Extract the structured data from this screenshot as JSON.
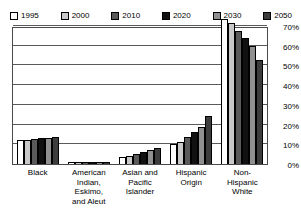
{
  "chart_data": {
    "type": "bar",
    "title": "",
    "xlabel": "",
    "ylabel": "",
    "ylim": [
      0,
      70
    ],
    "grid": true,
    "legend_position": "top",
    "y_ticks": [
      "0%",
      "10%",
      "20%",
      "30%",
      "40%",
      "50%",
      "60%",
      "70%"
    ],
    "y_tick_values": [
      0,
      10,
      20,
      30,
      40,
      50,
      60,
      70
    ],
    "categories": [
      "Black",
      "American Indian, Eskimo, and Aleut",
      "Asian and Pacific Islander",
      "Hispanic Origin",
      "Non-Hispanic White"
    ],
    "category_labels": [
      "Black",
      "American\nIndian,\nEskimo,\nand Aleut",
      "Asian and\nPacific\nIslander",
      "Hispanic\nOrigin",
      "Non-\nHispanic\nWhite"
    ],
    "series": [
      {
        "name": "1995",
        "color": "#ffffff",
        "values": [
          12.0,
          0.9,
          3.4,
          10.2,
          73.6
        ]
      },
      {
        "name": "2000",
        "color": "#c8c8c8",
        "values": [
          12.2,
          0.9,
          4.0,
          11.4,
          71.5
        ]
      },
      {
        "name": "2010",
        "color": "#5a5a5a",
        "values": [
          12.6,
          1.0,
          5.1,
          13.8,
          67.6
        ]
      },
      {
        "name": "2020",
        "color": "#111111",
        "values": [
          13.0,
          1.0,
          6.1,
          16.3,
          63.9
        ]
      },
      {
        "name": "2030",
        "color": "#909090",
        "values": [
          13.3,
          1.0,
          6.9,
          18.9,
          60.1
        ]
      },
      {
        "name": "2050",
        "color": "#3c3c3c",
        "values": [
          13.6,
          1.1,
          8.2,
          24.5,
          52.8
        ]
      }
    ]
  },
  "legend": {
    "items": [
      {
        "label": "1995",
        "color": "#ffffff"
      },
      {
        "label": "2000",
        "color": "#c8c8c8"
      },
      {
        "label": "2010",
        "color": "#5a5a5a"
      },
      {
        "label": "2020",
        "color": "#111111"
      },
      {
        "label": "2030",
        "color": "#909090"
      },
      {
        "label": "2050",
        "color": "#3c3c3c"
      }
    ]
  }
}
